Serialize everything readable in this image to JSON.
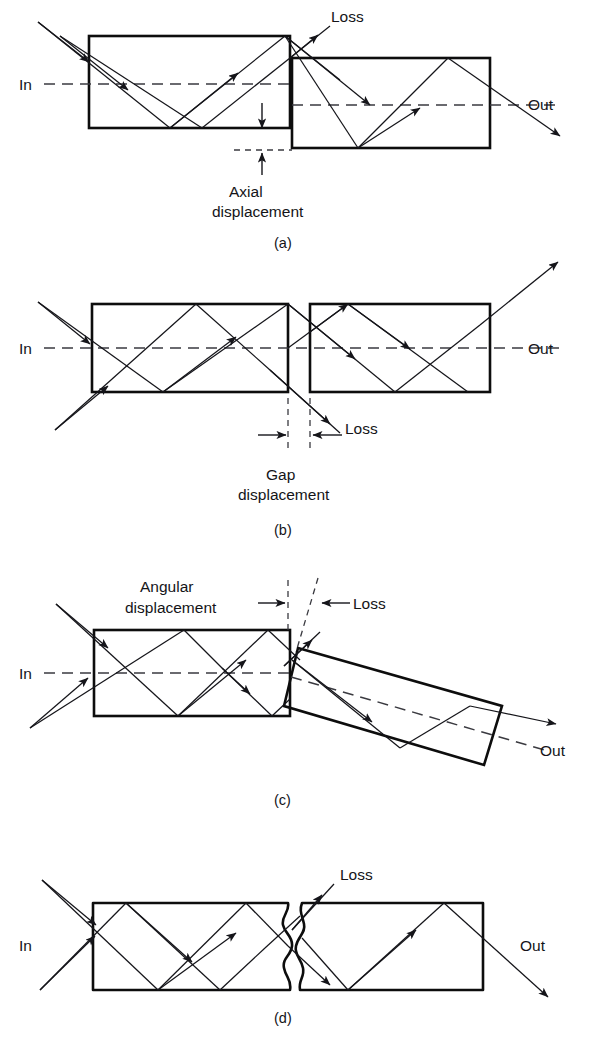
{
  "figure": {
    "background_color": "#ffffff",
    "line_color": "#0d0d0d",
    "ray_color": "#15151a",
    "dash_color": "#3a3a40"
  },
  "panels": [
    {
      "id": "a",
      "caption": "(a)",
      "mechanism": "axial displacement",
      "labels": {
        "input": "In",
        "output": "Out",
        "loss": "Loss",
        "displacement_line1": "Axial",
        "displacement_line2": "displacement"
      }
    },
    {
      "id": "b",
      "caption": "(b)",
      "mechanism": "gap displacement",
      "labels": {
        "input": "In",
        "output": "Out",
        "loss": "Loss",
        "displacement_line1": "Gap",
        "displacement_line2": "displacement"
      }
    },
    {
      "id": "c",
      "caption": "(c)",
      "mechanism": "angular displacement",
      "labels": {
        "input": "In",
        "output": "Out",
        "loss": "Loss",
        "displacement_line1": "Angular",
        "displacement_line2": "displacement"
      }
    },
    {
      "id": "d",
      "caption": "(d)",
      "mechanism": "rough end faces",
      "labels": {
        "input": "In",
        "output": "Out",
        "loss": "Loss"
      }
    }
  ]
}
